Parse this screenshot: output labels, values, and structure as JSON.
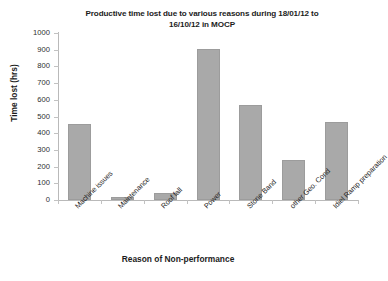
{
  "chart_data": {
    "type": "bar",
    "title": "Productive time lost due to various reasons during 18/01/12 to 16/10/12 in MOCP",
    "title_line1": "Productive time lost due to various reasons during 18/01/12 to",
    "title_line2": "16/10/12 in MOCP",
    "xlabel": "Reason of Non-performance",
    "ylabel": "Time lost (hrs)",
    "categories": [
      "Machine issues",
      "Maintenance",
      "Roof fall",
      "Power",
      "Stone Band",
      "other Geo. Cond",
      "Idiel Ramp preparation"
    ],
    "values": [
      455,
      18,
      42,
      905,
      570,
      240,
      470
    ],
    "ylim": [
      0,
      1000
    ],
    "yticks": [
      0,
      100,
      200,
      300,
      400,
      500,
      600,
      700,
      800,
      900,
      1000
    ],
    "ytick_labels": [
      "0",
      "100",
      "200",
      "300",
      "400",
      "500",
      "600",
      "700",
      "800",
      "900",
      "1000"
    ],
    "grid": false,
    "legend": false,
    "series_color": "#a9a9a9",
    "axis_color": "#b9b9b9",
    "text_color": "#1c1c1c"
  }
}
